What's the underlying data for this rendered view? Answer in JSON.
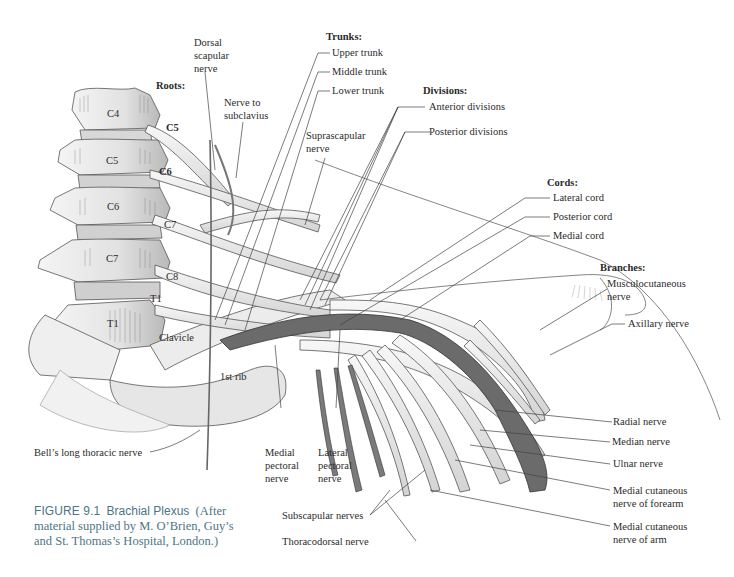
{
  "figure": {
    "number": "FIGURE 9.1",
    "title": "Brachial Plexus",
    "credit_line1": "(After",
    "credit_line2": "material supplied by M. O’Brien, Guy’s",
    "credit_line3": "and St. Thomas’s Hospital, London.)",
    "caption_color": "#4d7585"
  },
  "structures": {
    "vertebrae": [
      "C4",
      "C5",
      "C6",
      "C7",
      "T1"
    ],
    "clavicle": "Clavicle",
    "first_rib": "1st rib"
  },
  "labels": {
    "roots": {
      "heading": "Roots:",
      "items": [
        "C5",
        "C6",
        "C7",
        "C8",
        "T1"
      ]
    },
    "dorsal_scapular": [
      "Dorsal",
      "scapular",
      "nerve"
    ],
    "nerve_to_subclavius": [
      "Nerve to",
      "subclavius"
    ],
    "trunks": {
      "heading": "Trunks:",
      "items": [
        "Upper trunk",
        "Middle trunk",
        "Lower trunk"
      ]
    },
    "suprascapular": [
      "Suprascapular",
      "nerve"
    ],
    "divisions": {
      "heading": "Divisions:",
      "items": [
        "Anterior divisions",
        "Posterior divisions"
      ]
    },
    "cords": {
      "heading": "Cords:",
      "items": [
        "Lateral cord",
        "Posterior cord",
        "Medial cord"
      ]
    },
    "branches": {
      "heading": "Branches:",
      "musculocutaneous": [
        "Musculocutaneous",
        "nerve"
      ],
      "axillary": "Axillary nerve",
      "radial": "Radial nerve",
      "median": "Median nerve",
      "ulnar": "Ulnar nerve",
      "medial_cutaneous_forearm": [
        "Medial cutaneous",
        "nerve of forearm"
      ],
      "medial_cutaneous_arm": [
        "Medial cutaneous",
        "nerve of arm"
      ]
    },
    "long_thoracic": "Bell’s long thoracic nerve",
    "medial_pectoral": [
      "Medial",
      "pectoral",
      "nerve"
    ],
    "lateral_pectoral": [
      "Lateral",
      "pectoral",
      "nerve"
    ],
    "subscapular": "Subscapular nerves",
    "thoracodorsal": "Thoracodorsal nerve"
  }
}
